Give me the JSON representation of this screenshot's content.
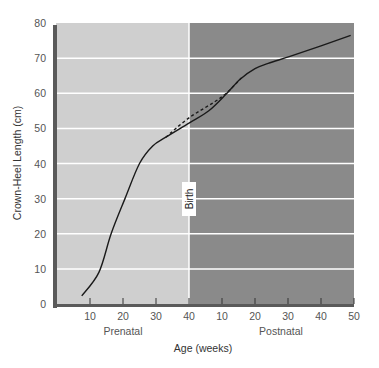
{
  "chart_data": {
    "type": "line",
    "title": "",
    "xlabel": "Age (weeks)",
    "ylabel": "Crown-Heel Length (cm)",
    "ylim": [
      0,
      80
    ],
    "y_ticks": [
      0,
      10,
      20,
      30,
      40,
      50,
      60,
      70,
      80
    ],
    "x_segments": [
      {
        "name": "Prenatal",
        "ticks": [
          10,
          20,
          30,
          40
        ],
        "range": [
          0,
          40
        ]
      },
      {
        "name": "Postnatal",
        "ticks": [
          10,
          20,
          30,
          40,
          50
        ],
        "range": [
          0,
          50
        ]
      }
    ],
    "grid": true,
    "annotations": [
      {
        "text": "Birth",
        "at": "prenatal week 40 / postnatal week 0"
      }
    ],
    "series": [
      {
        "name": "Growth curve",
        "style": "solid",
        "points": [
          {
            "phase": "prenatal",
            "week": 7.5,
            "cm": 2.3
          },
          {
            "phase": "prenatal",
            "week": 12.7,
            "cm": 9
          },
          {
            "phase": "prenatal",
            "week": 16.4,
            "cm": 20
          },
          {
            "phase": "prenatal",
            "week": 20.6,
            "cm": 30
          },
          {
            "phase": "prenatal",
            "week": 25,
            "cm": 40
          },
          {
            "phase": "prenatal",
            "week": 29,
            "cm": 45
          },
          {
            "phase": "prenatal",
            "week": 33,
            "cm": 47.5
          },
          {
            "phase": "prenatal",
            "week": 40,
            "cm": 51.5
          },
          {
            "phase": "postnatal",
            "week": 6,
            "cm": 55
          },
          {
            "phase": "postnatal",
            "week": 11.5,
            "cm": 60
          },
          {
            "phase": "postnatal",
            "week": 15.5,
            "cm": 64
          },
          {
            "phase": "postnatal",
            "week": 20,
            "cm": 67
          },
          {
            "phase": "postnatal",
            "week": 24,
            "cm": 68.5
          },
          {
            "phase": "postnatal",
            "week": 30.6,
            "cm": 70.5
          },
          {
            "phase": "postnatal",
            "week": 40,
            "cm": 73.5
          },
          {
            "phase": "postnatal",
            "week": 49,
            "cm": 76.5
          }
        ]
      },
      {
        "name": "Expected (dashed)",
        "style": "dashed",
        "points": [
          {
            "phase": "prenatal",
            "week": 33,
            "cm": 47.5
          },
          {
            "phase": "prenatal",
            "week": 40,
            "cm": 53
          },
          {
            "phase": "postnatal",
            "week": 10,
            "cm": 59
          },
          {
            "phase": "postnatal",
            "week": 16,
            "cm": 64.5
          }
        ]
      }
    ]
  },
  "labels": {
    "y_axis_title": "Crown-Heel Length (cm)",
    "x_axis_title": "Age (weeks)",
    "prenatal": "Prenatal",
    "postnatal": "Postnatal",
    "birth": "Birth"
  },
  "colors": {
    "prenatal_bg": "#cfcfcf",
    "postnatal_bg": "#8a8a8a",
    "gridline": "#ffffff",
    "axis_bar": "#5a5a5a",
    "curve": "#1a1a1a"
  }
}
